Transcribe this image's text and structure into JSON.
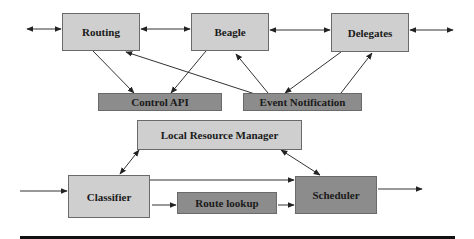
{
  "diagram": {
    "nodes": [
      {
        "id": "routing",
        "label": "Routing",
        "shade": "light"
      },
      {
        "id": "beagle",
        "label": "Beagle",
        "shade": "light"
      },
      {
        "id": "delegates",
        "label": "Delegates",
        "shade": "light"
      },
      {
        "id": "control_api",
        "label": "Control API",
        "shade": "dark"
      },
      {
        "id": "event_notification",
        "label": "Event Notification",
        "shade": "dark"
      },
      {
        "id": "local_resource_manager",
        "label": "Local Resource Manager",
        "shade": "light"
      },
      {
        "id": "classifier",
        "label": "Classifier",
        "shade": "light"
      },
      {
        "id": "route_lookup",
        "label": "Route lookup",
        "shade": "dark"
      },
      {
        "id": "scheduler",
        "label": "Scheduler",
        "shade": "dark"
      }
    ],
    "edges": [
      {
        "from": "external-left",
        "to": "routing",
        "type": "bidirectional"
      },
      {
        "from": "routing",
        "to": "beagle",
        "type": "bidirectional"
      },
      {
        "from": "beagle",
        "to": "delegates",
        "type": "bidirectional"
      },
      {
        "from": "delegates",
        "to": "external-right",
        "type": "bidirectional"
      },
      {
        "from": "routing",
        "to": "control_api",
        "type": "directed"
      },
      {
        "from": "beagle",
        "to": "control_api",
        "type": "directed"
      },
      {
        "from": "event_notification",
        "to": "routing",
        "type": "directed"
      },
      {
        "from": "event_notification",
        "to": "beagle",
        "type": "directed"
      },
      {
        "from": "delegates",
        "to": "event_notification",
        "type": "directed"
      },
      {
        "from": "event_notification",
        "to": "delegates",
        "type": "directed"
      },
      {
        "from": "local_resource_manager",
        "to": "classifier",
        "type": "bidirectional"
      },
      {
        "from": "local_resource_manager",
        "to": "scheduler",
        "type": "bidirectional"
      },
      {
        "from": "input",
        "to": "classifier",
        "type": "directed"
      },
      {
        "from": "classifier",
        "to": "scheduler",
        "type": "directed"
      },
      {
        "from": "classifier",
        "to": "route_lookup",
        "type": "directed"
      },
      {
        "from": "route_lookup",
        "to": "scheduler",
        "type": "directed"
      },
      {
        "from": "scheduler",
        "to": "output",
        "type": "directed"
      }
    ]
  },
  "colors": {
    "light_box": "#cfcfcf",
    "dark_box": "#8c8c8c",
    "border": "#6a6a6a",
    "line": "#333333"
  }
}
